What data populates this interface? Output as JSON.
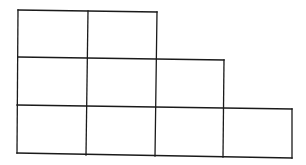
{
  "diagram": {
    "type": "staircase-grid",
    "rows": [
      {
        "row": 1,
        "cells": 2
      },
      {
        "row": 2,
        "cells": 3
      },
      {
        "row": 3,
        "cells": 4
      }
    ],
    "total_cells": 9,
    "line_color": "#1a1a1a",
    "background_color": "#ffffff"
  }
}
